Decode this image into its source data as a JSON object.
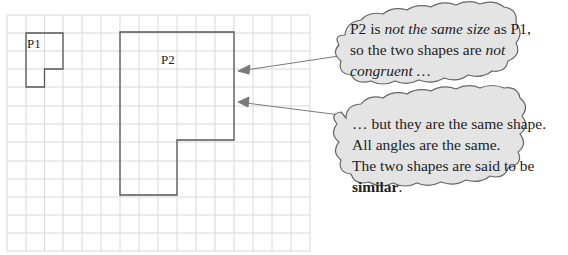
{
  "diagram": {
    "grid": {
      "columns": 16,
      "rows": 13,
      "line_color": "#d6d6d6"
    },
    "shapes": [
      {
        "label": "P1",
        "outline_color": "#555555"
      },
      {
        "label": "P2",
        "outline_color": "#555555"
      }
    ],
    "callouts": [
      {
        "lines": [
          [
            {
              "text": "P2 is ",
              "style": "normal"
            },
            {
              "text": "not the same size",
              "style": "italic"
            },
            {
              "text": " as P1,",
              "style": "normal"
            }
          ],
          [
            {
              "text": "so the two shapes are ",
              "style": "normal"
            },
            {
              "text": "not",
              "style": "italic"
            }
          ],
          [
            {
              "text": "congruent …",
              "style": "italic"
            }
          ]
        ],
        "fill": "#e3e3e3"
      },
      {
        "lines": [
          [
            {
              "text": "… but they are the same shape.",
              "style": "normal"
            }
          ],
          [
            {
              "text": "All angles are the same.",
              "style": "normal"
            }
          ],
          [
            {
              "text": "The two shapes are said to be",
              "style": "normal"
            }
          ],
          [
            {
              "text": "similar",
              "style": "bold"
            },
            {
              "text": ".",
              "style": "normal"
            }
          ]
        ],
        "fill": "#e3e3e3"
      }
    ],
    "arrow_color": "#777777"
  }
}
